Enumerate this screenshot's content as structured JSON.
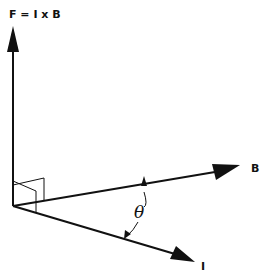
{
  "diagram": {
    "labels": {
      "force": "F = I x B",
      "field": "B",
      "current": "I",
      "angle": "θ"
    },
    "vectors": [
      {
        "name": "F",
        "direction": "perpendicular to I and B (up)"
      },
      {
        "name": "B",
        "direction": "right, slightly upward"
      },
      {
        "name": "I",
        "direction": "right, slightly downward"
      }
    ],
    "colors": {
      "ink": "#111111",
      "background": "#ffffff"
    }
  }
}
